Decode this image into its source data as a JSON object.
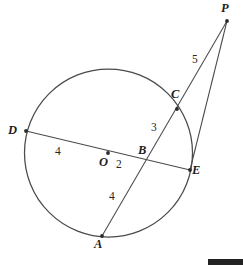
{
  "figure": {
    "type": "circle-geometry-diagram",
    "width": 243,
    "height": 269,
    "background_color": "#ffffff",
    "stroke_color": "#4a4a4a",
    "label_color": "#1d1d1d"
  },
  "circle": {
    "name": "main-circle",
    "center_x": 108.5,
    "center_y": 153,
    "radius": 84
  },
  "points": [
    {
      "id": "P",
      "label": "P",
      "x": 227,
      "y": 21,
      "label_x": 223,
      "label_y": 3,
      "dot": true
    },
    {
      "id": "C",
      "label": "C",
      "x": 177,
      "y": 109,
      "label_x": 172,
      "label_y": 89,
      "dot": true
    },
    {
      "id": "D",
      "label": "D",
      "x": 26,
      "y": 131,
      "label_x": 10,
      "label_y": 125,
      "dot": true
    },
    {
      "id": "O",
      "label": "O",
      "x": 108,
      "y": 153,
      "label_x": 100,
      "label_y": 158,
      "dot": true
    },
    {
      "id": "B",
      "label": "B",
      "x": 144,
      "y": 160,
      "label_x": 139,
      "label_y": 146,
      "dot": false
    },
    {
      "id": "E",
      "label": "E",
      "x": 190,
      "y": 170,
      "label_x": 193,
      "label_y": 166,
      "dot": true
    },
    {
      "id": "A",
      "label": "A",
      "x": 102,
      "y": 236,
      "label_x": 95,
      "label_y": 240,
      "dot": true
    }
  ],
  "segments": [
    {
      "name": "secant-a-to-p",
      "from": "A",
      "to": "P"
    },
    {
      "name": "chord-d-to-e",
      "from": "D",
      "to": "E"
    },
    {
      "name": "tangent-e-to-p",
      "from": "E",
      "to": "P"
    }
  ],
  "measures": [
    {
      "name": "length-do",
      "value": "4",
      "x": 55,
      "y": 146,
      "segment": "D-O"
    },
    {
      "name": "length-ob",
      "value": "2",
      "x": 116,
      "y": 159,
      "segment": "O-B"
    },
    {
      "name": "length-bc",
      "value": "3",
      "x": 151,
      "y": 122,
      "segment": "B-C"
    },
    {
      "name": "length-ab",
      "value": "4",
      "x": 109,
      "y": 191,
      "segment": "A-B"
    },
    {
      "name": "length-cp",
      "value": "5",
      "x": 192,
      "y": 54,
      "segment": "C-P"
    }
  ],
  "bottom_bar": {
    "name": "bottom-right-black-bar",
    "x": 208,
    "y": 259,
    "width": 35,
    "height": 6,
    "color": "#222222"
  }
}
